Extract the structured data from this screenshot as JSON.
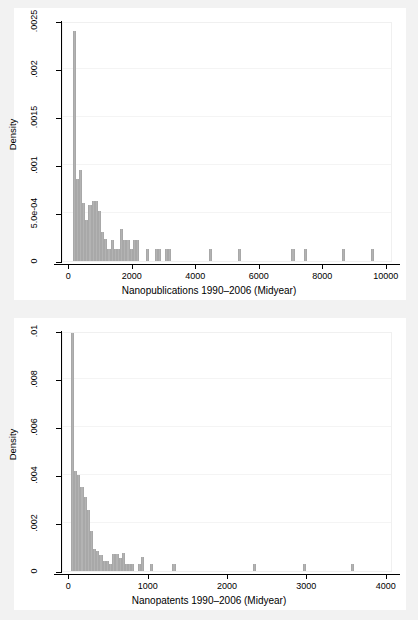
{
  "figure": {
    "background_color": "#f2f2f2",
    "plot_background_color": "#ffffff",
    "bar_color": "#b3b3b3",
    "axis_color": "#000000"
  },
  "chart_data": [
    {
      "type": "bar",
      "title": "",
      "xlabel": "Nanopublications 1990–2006 (Midyear)",
      "ylabel": "Density",
      "xlim": [
        -200,
        10200
      ],
      "ylim": [
        0,
        0.0025
      ],
      "grid": true,
      "legend": "none",
      "xticks": [
        0,
        2000,
        4000,
        6000,
        8000,
        10000
      ],
      "xtick_labels": [
        "0",
        "2000",
        "4000",
        "6000",
        "8000",
        "10000"
      ],
      "yticks": [
        0,
        0.0005,
        0.001,
        0.0015,
        0.002,
        0.0025
      ],
      "ytick_labels": [
        "0",
        "5.0e-04",
        ".001",
        ".0015",
        ".002",
        ".0025"
      ],
      "bin_width": 100,
      "bins": [
        {
          "x": 150,
          "y": 0.0024
        },
        {
          "x": 250,
          "y": 0.00085
        },
        {
          "x": 350,
          "y": 0.00095
        },
        {
          "x": 450,
          "y": 0.0006
        },
        {
          "x": 550,
          "y": 0.00043
        },
        {
          "x": 650,
          "y": 0.00058
        },
        {
          "x": 750,
          "y": 0.00063
        },
        {
          "x": 850,
          "y": 0.00063
        },
        {
          "x": 950,
          "y": 0.00052
        },
        {
          "x": 1050,
          "y": 0.0003
        },
        {
          "x": 1150,
          "y": 0.00023
        },
        {
          "x": 1250,
          "y": 0.00012
        },
        {
          "x": 1350,
          "y": 0.00022
        },
        {
          "x": 1450,
          "y": 0.00012
        },
        {
          "x": 1550,
          "y": 0.00012
        },
        {
          "x": 1650,
          "y": 0.00033
        },
        {
          "x": 1750,
          "y": 0.00022
        },
        {
          "x": 1850,
          "y": 0.00022
        },
        {
          "x": 1950,
          "y": 0.00012
        },
        {
          "x": 2050,
          "y": 0.00022
        },
        {
          "x": 2150,
          "y": 0.00022
        },
        {
          "x": 2450,
          "y": 0.00012
        },
        {
          "x": 2750,
          "y": 0.00012
        },
        {
          "x": 2850,
          "y": 0.00012
        },
        {
          "x": 3050,
          "y": 0.00012
        },
        {
          "x": 3150,
          "y": 0.00012
        },
        {
          "x": 4450,
          "y": 0.00012
        },
        {
          "x": 5350,
          "y": 0.00012
        },
        {
          "x": 7050,
          "y": 0.00012
        },
        {
          "x": 7450,
          "y": 0.00012
        },
        {
          "x": 8650,
          "y": 0.00012
        },
        {
          "x": 9550,
          "y": 0.00012
        }
      ]
    },
    {
      "type": "bar",
      "title": "",
      "xlabel": "Nanopatents 1990–2006 (Midyear)",
      "ylabel": "Density",
      "xlim": [
        -80,
        4080
      ],
      "ylim": [
        0,
        0.01
      ],
      "grid": true,
      "legend": "none",
      "xticks": [
        0,
        1000,
        2000,
        3000,
        4000
      ],
      "xtick_labels": [
        "0",
        "1000",
        "2000",
        "3000",
        "4000"
      ],
      "yticks": [
        0,
        0.002,
        0.004,
        0.006,
        0.008,
        0.01
      ],
      "ytick_labels": [
        "0",
        ".002",
        ".004",
        ".006",
        ".008",
        ".01"
      ],
      "bin_width": 40,
      "bins": [
        {
          "x": 40,
          "y": 0.01
        },
        {
          "x": 80,
          "y": 0.00415
        },
        {
          "x": 120,
          "y": 0.004
        },
        {
          "x": 160,
          "y": 0.0035
        },
        {
          "x": 200,
          "y": 0.0031
        },
        {
          "x": 240,
          "y": 0.00255
        },
        {
          "x": 280,
          "y": 0.00165
        },
        {
          "x": 320,
          "y": 0.0009
        },
        {
          "x": 360,
          "y": 0.00085
        },
        {
          "x": 400,
          "y": 0.00065
        },
        {
          "x": 440,
          "y": 0.0004
        },
        {
          "x": 480,
          "y": 0.00042
        },
        {
          "x": 520,
          "y": 0.0003
        },
        {
          "x": 560,
          "y": 0.00072
        },
        {
          "x": 600,
          "y": 0.00072
        },
        {
          "x": 640,
          "y": 0.00055
        },
        {
          "x": 680,
          "y": 0.00075
        },
        {
          "x": 720,
          "y": 0.00028
        },
        {
          "x": 760,
          "y": 0.0003
        },
        {
          "x": 800,
          "y": 0.00028
        },
        {
          "x": 880,
          "y": 0.0003
        },
        {
          "x": 920,
          "y": 0.00058
        },
        {
          "x": 1040,
          "y": 0.0003
        },
        {
          "x": 1320,
          "y": 0.00028
        },
        {
          "x": 2330,
          "y": 0.00028
        },
        {
          "x": 2960,
          "y": 0.0003
        },
        {
          "x": 3570,
          "y": 0.00028
        }
      ]
    }
  ]
}
